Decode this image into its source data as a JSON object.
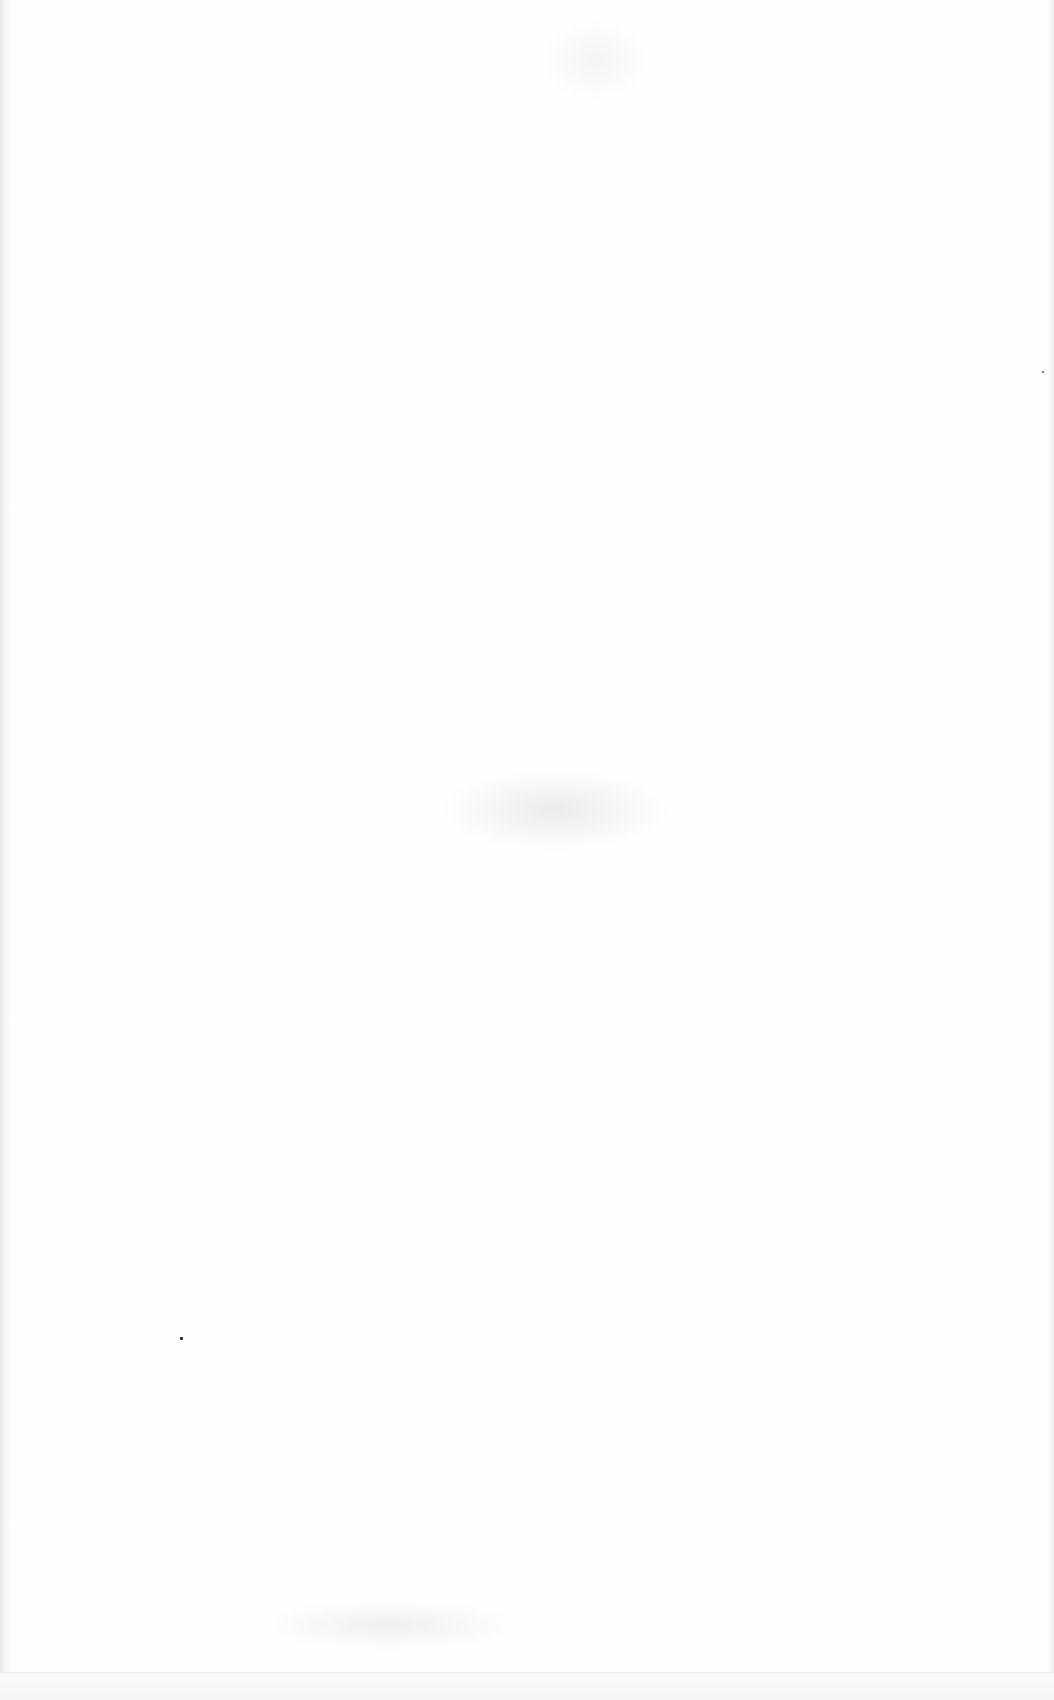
{
  "document": {
    "type": "blank scanned page",
    "visible_text": "",
    "background_color": "#fefefe",
    "edge_shadow_color": "#e6e6e6",
    "bottom_line_color": "#f2f2f2",
    "artifacts": [
      {
        "name": "speck",
        "x": 181,
        "y": 1338,
        "color": "#222222"
      },
      {
        "name": "speck",
        "x": 1043,
        "y": 372,
        "color": "#555555"
      }
    ],
    "bleed_through_regions": [
      {
        "x": 440,
        "y": 770,
        "w": 230,
        "h": 80
      },
      {
        "x": 540,
        "y": 20,
        "w": 110,
        "h": 80
      },
      {
        "x": 260,
        "y": 1600,
        "w": 260,
        "h": 50
      }
    ]
  }
}
